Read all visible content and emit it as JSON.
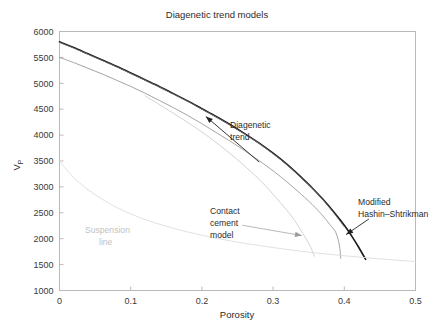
{
  "chart_data": {
    "type": "line",
    "title": "Diagenetic trend models",
    "xlabel": "Porosity",
    "ylabel": "Vp",
    "ylabel_base": "V",
    "ylabel_sub": "P",
    "xlim": [
      0,
      0.5
    ],
    "ylim": [
      1000,
      6000
    ],
    "xticks": [
      "0",
      "0.1",
      "0.2",
      "0.3",
      "0.4",
      "0.5"
    ],
    "xtick_values": [
      0,
      0.1,
      0.2,
      0.3,
      0.4,
      0.5
    ],
    "yticks": [
      "1000",
      "1500",
      "2000",
      "2500",
      "3000",
      "3500",
      "4000",
      "4500",
      "5000",
      "5500",
      "6000"
    ],
    "ytick_values": [
      1000,
      1500,
      2000,
      2500,
      3000,
      3500,
      4000,
      4500,
      5000,
      5500,
      6000
    ],
    "grid": false,
    "legend_position": "none",
    "series": [
      {
        "name": "Modified Hashin-Shtrikman",
        "color": "#1a1a1a",
        "width": 1.6,
        "x": [
          0.0,
          0.02,
          0.04,
          0.06,
          0.08,
          0.1,
          0.12,
          0.14,
          0.16,
          0.18,
          0.2,
          0.22,
          0.24,
          0.26,
          0.28,
          0.3,
          0.32,
          0.34,
          0.355,
          0.37,
          0.385,
          0.4,
          0.41,
          0.42,
          0.43
        ],
        "y": [
          5800,
          5690,
          5570,
          5450,
          5330,
          5200,
          5070,
          4940,
          4800,
          4660,
          4510,
          4360,
          4200,
          4030,
          3850,
          3650,
          3430,
          3180,
          2980,
          2760,
          2520,
          2260,
          2060,
          1840,
          1600
        ]
      },
      {
        "name": "Diagenetic trend upper",
        "color": "#6d6d6d",
        "width": 0.9,
        "x": [
          0.0,
          0.02,
          0.04,
          0.06,
          0.08,
          0.1,
          0.12,
          0.14,
          0.16,
          0.18,
          0.2,
          0.22,
          0.24,
          0.26,
          0.28,
          0.3,
          0.32,
          0.34,
          0.355,
          0.37,
          0.385,
          0.395,
          0.4
        ],
        "y": [
          5790,
          5680,
          5560,
          5440,
          5320,
          5190,
          5060,
          4930,
          4790,
          4650,
          4500,
          4350,
          4190,
          4020,
          3840,
          3640,
          3420,
          3170,
          2970,
          2750,
          2500,
          2320,
          2230
        ]
      },
      {
        "name": "Contact cement model upper",
        "color": "#9a9a9a",
        "width": 0.9,
        "x": [
          0.0,
          0.02,
          0.04,
          0.06,
          0.08,
          0.1,
          0.12,
          0.14,
          0.16,
          0.18,
          0.2,
          0.22,
          0.24,
          0.26,
          0.28,
          0.3,
          0.32,
          0.34,
          0.355,
          0.37,
          0.38,
          0.388,
          0.393,
          0.395
        ],
        "y": [
          5500,
          5400,
          5290,
          5180,
          5060,
          4940,
          4810,
          4670,
          4530,
          4380,
          4220,
          4050,
          3880,
          3700,
          3510,
          3310,
          3090,
          2850,
          2660,
          2440,
          2270,
          2120,
          1880,
          1620
        ]
      },
      {
        "name": "Contact cement model lower",
        "color": "#c8c8c8",
        "width": 0.8,
        "x": [
          0.12,
          0.16,
          0.2,
          0.24,
          0.27,
          0.29,
          0.31,
          0.325,
          0.335,
          0.345,
          0.352,
          0.356,
          0.358
        ],
        "y": [
          4760,
          4420,
          4060,
          3640,
          3280,
          3010,
          2700,
          2450,
          2250,
          2030,
          1860,
          1730,
          1660
        ]
      },
      {
        "name": "Suspension line",
        "color": "#dcdcdc",
        "width": 0.9,
        "x": [
          0.0,
          0.01,
          0.02,
          0.035,
          0.05,
          0.07,
          0.09,
          0.12,
          0.15,
          0.18,
          0.22,
          0.26,
          0.3,
          0.35,
          0.4,
          0.45,
          0.5
        ],
        "y": [
          3500,
          3330,
          3180,
          3000,
          2850,
          2680,
          2540,
          2370,
          2240,
          2130,
          2010,
          1910,
          1830,
          1740,
          1670,
          1610,
          1560
        ]
      }
    ],
    "annotations": [
      {
        "id": "diagenetic-trend",
        "text_lines": [
          "Diagenetic",
          "trend"
        ],
        "color": "#2b2b2b",
        "arrow": {
          "tip_x": 0.2055,
          "tip_y": 4360,
          "tail_x": 0.2805,
          "tail_y": 3480
        }
      },
      {
        "id": "modified-hashin-shtrikman",
        "text_lines": [
          "Modified",
          "Hashin–Shtrikman"
        ],
        "color": "#2b2b2b",
        "arrow": {
          "tip_x": 0.4025,
          "tip_y": 2080,
          "tail_x": 0.4345,
          "tail_y": 2380
        }
      },
      {
        "id": "contact-cement-model",
        "text_lines": [
          "Contact",
          "cement",
          "model"
        ],
        "color": "#2b2b2b",
        "leader": {
          "tip_x": 0.3405,
          "tip_y": 2060,
          "tail_x": 0.2565,
          "tail_y": 2260
        }
      },
      {
        "id": "suspension-line",
        "text_lines": [
          "Suspension",
          "line"
        ],
        "color": "#c2c2c2"
      }
    ]
  }
}
